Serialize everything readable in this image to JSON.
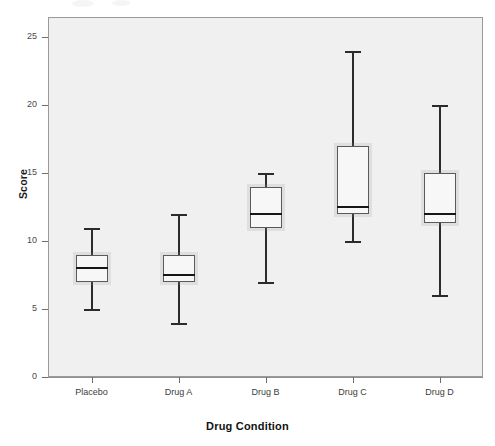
{
  "chart_data": {
    "type": "box",
    "title": "",
    "xlabel": "Drug Condition",
    "ylabel": "Score",
    "categories": [
      "Placebo",
      "Drug A",
      "Drug B",
      "Drug C",
      "Drug D"
    ],
    "ylim": [
      0,
      26.5
    ],
    "yticks": [
      0,
      5,
      10,
      15,
      20,
      25
    ],
    "ytick_labels": [
      "0",
      "5",
      "10",
      "15",
      "20",
      "25"
    ],
    "grid": false,
    "legend": "none",
    "boxes": [
      {
        "category": "Placebo",
        "whisker_low": 5,
        "q1": 7,
        "median": 8,
        "q3": 9,
        "whisker_high": 11
      },
      {
        "category": "Drug A",
        "whisker_low": 4,
        "q1": 7,
        "median": 7.5,
        "q3": 9,
        "whisker_high": 12
      },
      {
        "category": "Drug B",
        "whisker_low": 7,
        "q1": 11,
        "median": 12,
        "q3": 14,
        "whisker_high": 15
      },
      {
        "category": "Drug C",
        "whisker_low": 10,
        "q1": 12,
        "median": 12.5,
        "q3": 17,
        "whisker_high": 24
      },
      {
        "category": "Drug D",
        "whisker_low": 6,
        "q1": 11.3,
        "median": 12,
        "q3": 15,
        "whisker_high": 20
      }
    ],
    "colors": {
      "plot_background": "#f0f0f0",
      "box_fill": "#f7f7f7",
      "box_border": "#5a5a5a",
      "whisker": "#2b2b2b",
      "median": "#161616",
      "axis": "#8f8f8f",
      "text": "#1b1b1b"
    }
  }
}
